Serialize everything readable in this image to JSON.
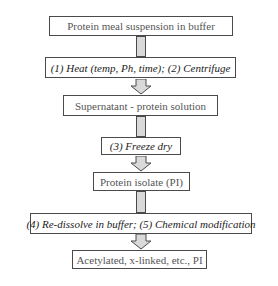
{
  "flowchart": {
    "nodes": [
      {
        "id": "n1",
        "type": "state",
        "label": "Protein meal suspension in buffer"
      },
      {
        "id": "n2",
        "type": "step",
        "label": "(1) Heat (temp, Ph, time); (2) Centrifuge"
      },
      {
        "id": "n3",
        "type": "state",
        "label": "Supernatant - protein solution"
      },
      {
        "id": "n4",
        "type": "step",
        "label": "(3) Freeze dry"
      },
      {
        "id": "n5",
        "type": "state",
        "label": "Protein isolate (PI)"
      },
      {
        "id": "n6",
        "type": "step",
        "label": "(4) Re-dissolve in buffer; (5) Chemical modification"
      },
      {
        "id": "n7",
        "type": "state",
        "label": "Acetylated, x-linked, etc., PI"
      }
    ],
    "edges": [
      {
        "from": "n1",
        "to": "n2",
        "style": "bar"
      },
      {
        "from": "n2",
        "to": "n3",
        "style": "block-arrow"
      },
      {
        "from": "n3",
        "to": "n4",
        "style": "bar"
      },
      {
        "from": "n4",
        "to": "n5",
        "style": "block-arrow"
      },
      {
        "from": "n5",
        "to": "n6",
        "style": "bar"
      },
      {
        "from": "n6",
        "to": "n7",
        "style": "block-arrow"
      }
    ],
    "colors": {
      "connector_fill": "#d9d9d9",
      "border": "#4a4a4a",
      "state_text": "#555555",
      "step_text": "#222222"
    }
  }
}
